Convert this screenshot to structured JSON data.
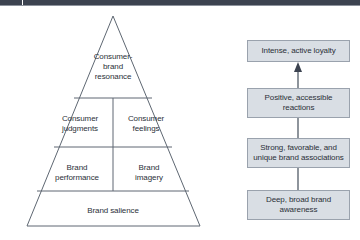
{
  "header": {
    "bar_color": "#3c4350"
  },
  "diagram": {
    "pyramid": {
      "name": "cbbe-pyramid",
      "outline_color": "#5e6772",
      "tiers": [
        {
          "id": "resonance",
          "label": "Consumer-\nbrand\nresonance"
        },
        {
          "id": "judgments",
          "label": "Consumer\njudgments"
        },
        {
          "id": "feelings",
          "label": "Consumer\nfeelings"
        },
        {
          "id": "performance",
          "label": "Brand\nperformance"
        },
        {
          "id": "imagery",
          "label": "Brand\nimagery"
        },
        {
          "id": "salience",
          "label": "Brand salience"
        }
      ]
    },
    "flow": {
      "name": "brand-building-steps",
      "box_fill": "#d9dee4",
      "box_border": "#9aa2ad",
      "connector_color": "#5e6772",
      "boxes": [
        {
          "id": "loyalty",
          "label": "Intense, active loyalty"
        },
        {
          "id": "reactions",
          "label": "Positive, accessible\nreactions"
        },
        {
          "id": "associations",
          "label": "Strong, favorable, and\nunique brand associations"
        },
        {
          "id": "awareness",
          "label": "Deep, broad brand\nawareness"
        }
      ]
    }
  }
}
